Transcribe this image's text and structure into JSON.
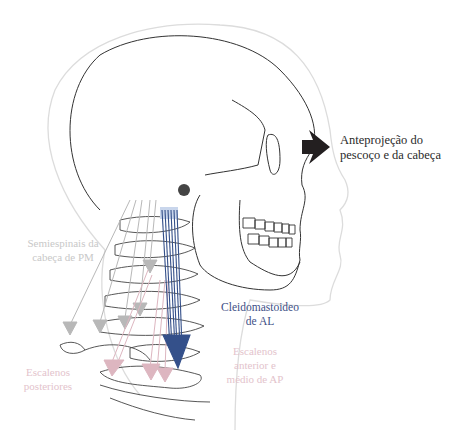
{
  "diagram": {
    "labels": {
      "main": [
        "Anteprojeção do",
        "pescoço e da cabeça"
      ],
      "semiespinais": [
        "Semiespinais da",
        "cabeça de PM"
      ],
      "cleidomastoideo": [
        "Cleidomastoideo",
        "de AL"
      ],
      "escalenos_anterior": [
        "Escalenos",
        "anterior e",
        "médio de AP"
      ],
      "escalenos_posteriores": [
        "Escalenos",
        "posteriores"
      ]
    },
    "colors": {
      "outline": "#3a3a3a",
      "skin_outline": "#d6d6d6",
      "forward_arrow": "#231f20",
      "semiespinais_arrows": "#b8b8b8",
      "cleidomastoideo_arrows": "#34508a",
      "escalenos_arrows": "#ddb6c0",
      "semiespinais_text": "#c8c8c8",
      "cleidomastoideo_text": "#3e4f86",
      "escalenos_text": "#e3c3cc"
    }
  }
}
